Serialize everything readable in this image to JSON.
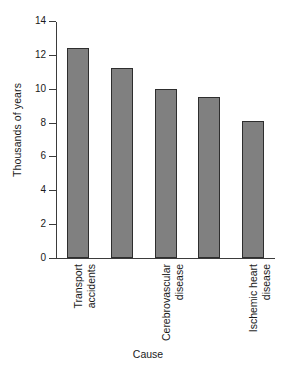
{
  "chart_data": {
    "type": "bar",
    "title": "",
    "subtitle": "",
    "xlabel": "Cause",
    "ylabel": "Thousands of years",
    "categories": [
      "Transport accidents",
      "",
      "Cerebrovascular disease",
      "",
      "Ischemic heart disease"
    ],
    "values": [
      12.4,
      11.2,
      10.0,
      9.5,
      8.1
    ],
    "ylim": [
      0,
      14
    ],
    "ytick_values": [
      0,
      2,
      4,
      6,
      8,
      10,
      12,
      14
    ],
    "ytick_labels": [
      "0",
      "2",
      "4",
      "6",
      "8",
      "10",
      "12",
      "14"
    ],
    "grid": false,
    "legend": null,
    "bar_color": "#808080",
    "bar_edge_color": "#2e2e2e",
    "background_color": "#ffffff",
    "axis_color": "#3b3b3b",
    "annotations": [],
    "xtick_labels_shown": [
      {
        "index": 0,
        "line1": "Transport",
        "line2": "accidents"
      },
      {
        "index": 2,
        "line1": "Cerebrovascular",
        "line2": "disease"
      },
      {
        "index": 4,
        "line1": "Ischemic heart",
        "line2": "disease"
      }
    ]
  }
}
